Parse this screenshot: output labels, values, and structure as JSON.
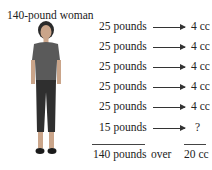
{
  "title": "140-pound woman",
  "rows": [
    {
      "weight": "25 pounds",
      "volume": "4 cc"
    },
    {
      "weight": "25 pounds",
      "volume": "4 cc"
    },
    {
      "weight": "25 pounds",
      "volume": "4 cc"
    },
    {
      "weight": "25 pounds",
      "volume": "4 cc"
    },
    {
      "weight": "25 pounds",
      "volume": "4 cc"
    },
    {
      "weight": "15 pounds",
      "volume": "?"
    }
  ],
  "total": {
    "weight": "140 pounds",
    "connector": "over",
    "volume": "20 cc"
  }
}
